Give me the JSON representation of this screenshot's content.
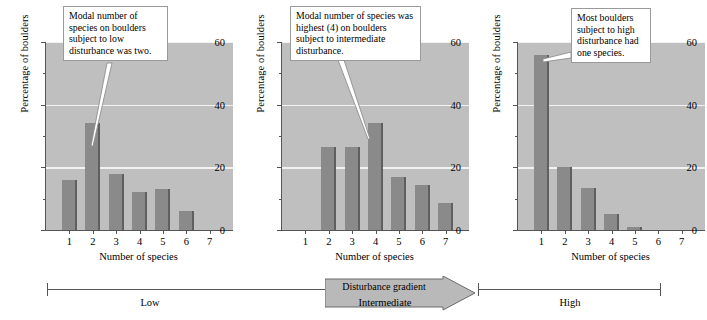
{
  "figure": {
    "panels": [
      {
        "id": "low",
        "ylabel": "Percentage of boulders",
        "xlabel": "Number of species",
        "callout": "Modal number of species on boulders subject to low disturbance was two."
      },
      {
        "id": "intermediate",
        "ylabel": "Percentage of boulders",
        "xlabel": "Number of species",
        "callout": "Modal number of species was highest (4) on boulders subject to intermediate disturbance."
      },
      {
        "id": "high",
        "ylabel": "Percentage of boulders",
        "xlabel": "Number of species",
        "callout": "Most boulders subject to high disturbance had one species."
      }
    ],
    "yticks": [
      "0",
      "20",
      "40",
      "60"
    ],
    "xticks": [
      "1",
      "2",
      "3",
      "4",
      "5",
      "6",
      "7"
    ],
    "gradient": {
      "arrow_label": "Disturbance gradient",
      "low_label": "Low",
      "intermediate_label": "Intermediate",
      "high_label": "High"
    },
    "colors": {
      "plot_background": "#bfbfbf",
      "gridline": "#f2f2f2",
      "bar_face": "#8a8a8a",
      "bar_edge": "#5f5f5f",
      "axis": "#555555",
      "callout_border": "#9a9a9a",
      "callout_background": "#ffffff",
      "arrow_fill": "#b9b9b9"
    }
  },
  "chart_data": [
    {
      "type": "bar",
      "title": "Low disturbance",
      "categories": [
        1,
        2,
        3,
        4,
        5,
        6,
        7
      ],
      "values": [
        16,
        34,
        18,
        12,
        13,
        6,
        0
      ],
      "xlabel": "Number of species",
      "ylabel": "Percentage of boulders",
      "ylim": [
        0,
        60
      ],
      "yticks": [
        0,
        20,
        40,
        60
      ],
      "yticks_minor": [
        10,
        30,
        50
      ],
      "grid": true,
      "legend": "none",
      "annotations": [
        "Modal number of species on boulders subject to low disturbance was two."
      ]
    },
    {
      "type": "bar",
      "title": "Intermediate disturbance",
      "categories": [
        1,
        2,
        3,
        4,
        5,
        6,
        7
      ],
      "values": [
        0,
        26.5,
        26.5,
        34,
        17,
        14.5,
        8.5
      ],
      "xlabel": "Number of species",
      "ylabel": "Percentage of boulders",
      "ylim": [
        0,
        60
      ],
      "yticks": [
        0,
        20,
        40,
        60
      ],
      "yticks_minor": [
        10,
        30,
        50
      ],
      "grid": true,
      "legend": "none",
      "annotations": [
        "Modal number of species was highest (4) on boulders subject to intermediate disturbance."
      ]
    },
    {
      "type": "bar",
      "title": "High disturbance",
      "categories": [
        1,
        2,
        3,
        4,
        5,
        6,
        7
      ],
      "values": [
        56,
        20,
        13.5,
        5,
        1,
        0,
        0
      ],
      "xlabel": "Number of species",
      "ylabel": "Percentage of boulders",
      "ylim": [
        0,
        60
      ],
      "yticks": [
        0,
        20,
        40,
        60
      ],
      "yticks_minor": [
        10,
        30,
        50
      ],
      "grid": true,
      "legend": "none",
      "annotations": [
        "Most boulders subject to high disturbance had one species."
      ]
    }
  ]
}
